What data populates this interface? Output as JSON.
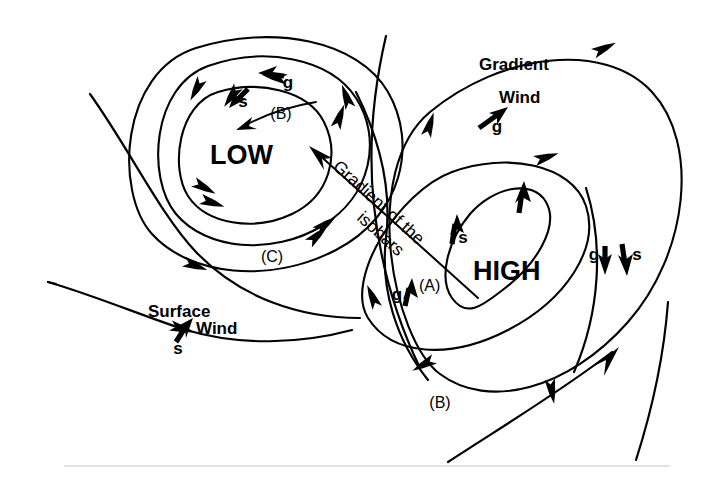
{
  "figure": {
    "title_center_low": "LOW",
    "title_center_high": "HIGH",
    "background_color": "#ffffff",
    "ink_color": "#000000",
    "separator_color": "#d9d9d9",
    "width": 702,
    "height": 481
  },
  "labels": {
    "low": "LOW",
    "high": "HIGH",
    "gradient_of_isobars": "Gradient of the isobars",
    "gradient_of_isobars_line1": "Gradient of the",
    "gradient_of_isobars_line2": "isobars",
    "gradient_wind_line1": "Gradient",
    "gradient_wind_line2": "Wind",
    "surface_wind_line1": "Surface",
    "surface_wind_line2": "Wind"
  },
  "vector_labels": {
    "g": "g",
    "s": "s"
  },
  "point_labels": {
    "a": "(A)",
    "b_low": "(B)",
    "c_low": "(C)",
    "b_high": "(B)"
  },
  "annotations": [
    {
      "name": "low-g-vector",
      "label": "g",
      "x": 288,
      "y": 83,
      "direction": "left",
      "meaning": "gradient wind at low"
    },
    {
      "name": "low-s-vector",
      "label": "s",
      "x": 243,
      "y": 101,
      "direction": "down-left",
      "meaning": "surface wind at low"
    },
    {
      "name": "high-gradient-wind-g",
      "label": "g",
      "x": 496,
      "y": 125,
      "direction": "up-right",
      "meaning": "gradient wind at high"
    },
    {
      "name": "high-s-vector",
      "label": "s",
      "x": 458,
      "y": 236,
      "direction": "up",
      "meaning": "surface wind inner high"
    },
    {
      "name": "high-a-g-vector",
      "label": "g",
      "x": 397,
      "y": 292,
      "direction": "up",
      "meaning": "gradient wind at point A"
    },
    {
      "name": "right-g-vector",
      "label": "g",
      "x": 598,
      "y": 255,
      "direction": "down",
      "meaning": "gradient wind right flank"
    },
    {
      "name": "right-s-vector",
      "label": "s",
      "x": 628,
      "y": 255,
      "direction": "down",
      "meaning": "surface wind right flank"
    },
    {
      "name": "surface-wind-s-vector",
      "label": "s",
      "x": 180,
      "y": 345,
      "direction": "up-right",
      "meaning": "surface wind lower left"
    }
  ],
  "label_positions": {
    "low": {
      "x": 210,
      "y": 164
    },
    "high": {
      "x": 473,
      "y": 280
    },
    "b_low": {
      "x": 281,
      "y": 113
    },
    "c_low": {
      "x": 263,
      "y": 256
    },
    "a": {
      "x": 419,
      "y": 286
    },
    "b_high": {
      "x": 428,
      "y": 403
    },
    "gradient_wind": {
      "x": 481,
      "y": 94
    },
    "surface_wind": {
      "x": 148,
      "y": 316
    }
  },
  "legend": {
    "g_meaning": "gradient wind",
    "s_meaning": "surface wind"
  }
}
